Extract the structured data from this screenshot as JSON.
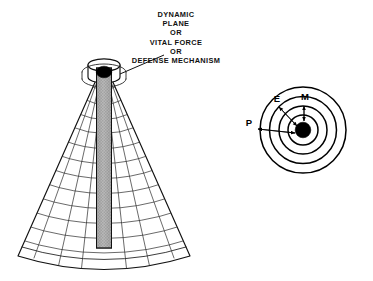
{
  "figure": {
    "background_color": "#ffffff",
    "ink_color": "#000000",
    "caption_lines": [
      "DYNAMIC",
      "PLANE",
      "OR",
      "VITAL FORCE",
      "OR",
      "DEFENSE  MECHANISM"
    ],
    "caption_center_x": 176,
    "caption_first_line_y": 17,
    "caption_line_height": 9.2
  },
  "cone_diagram": {
    "name": "wireframe-cone",
    "apex_x": 104,
    "neck_top_y": 62,
    "base_center_y": 256,
    "base_half_width": 86,
    "ring_count": 13,
    "meridian_count": 7,
    "column": {
      "name": "vertical-shaded-column",
      "left_x": 96.5,
      "right_x": 111.5,
      "top_y": 68,
      "bottom_y": 248,
      "fill_color": "#a8a8a8",
      "pattern": "cross-hatch"
    },
    "cap": {
      "name": "black-ellipse-cap",
      "cx": 104,
      "cy": 72,
      "rx": 7.5,
      "ry": 5.5,
      "color": "#000000"
    },
    "leader_line": {
      "name": "caption-leader-line",
      "x1": 164,
      "y1": 55,
      "x2": 112,
      "y2": 76
    }
  },
  "circle_diagram": {
    "name": "concentric-circles",
    "center_x": 303,
    "center_y": 130,
    "radii": [
      43,
      33.5,
      24,
      15
    ],
    "core": {
      "name": "core-dot",
      "radius": 7.5,
      "color": "#000000"
    },
    "labels": [
      {
        "text": "P",
        "x": 249,
        "y": 126,
        "name": "label-p"
      },
      {
        "text": "E",
        "x": 277,
        "y": 100,
        "name": "label-e"
      },
      {
        "text": "M",
        "x": 306,
        "y": 99,
        "name": "label-m"
      }
    ],
    "arrows": [
      {
        "name": "arrow-p-inward",
        "x1": 256,
        "y1": 130,
        "x2": 296,
        "y2": 134
      },
      {
        "name": "arrow-e-inward",
        "x1": 278,
        "y1": 106,
        "x2": 298,
        "y2": 128
      },
      {
        "name": "arrow-m-inward",
        "x1": 304,
        "y1": 104,
        "x2": 304,
        "y2": 121
      },
      {
        "name": "arrow-e-outward",
        "x1": 297,
        "y1": 127,
        "x2": 279,
        "y2": 107
      },
      {
        "name": "arrow-p-outward",
        "x1": 295,
        "y1": 133,
        "x2": 257,
        "y2": 129
      }
    ]
  }
}
